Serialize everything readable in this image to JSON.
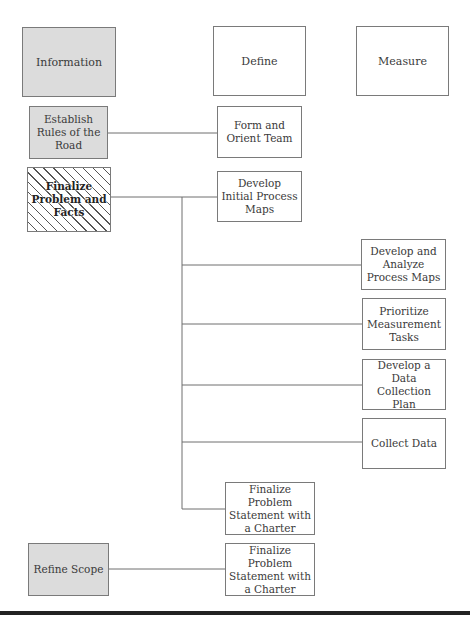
{
  "diagram": {
    "columns": {
      "information": "Information",
      "define": "Define",
      "measure": "Measure"
    },
    "information_steps": {
      "establish_rules": "Establish Rules of the Road",
      "finalize_problem_facts": "Finalize Problem and Facts",
      "refine_scope": "Refine Scope"
    },
    "define_steps": {
      "form_orient_team": "Form and Orient Team",
      "develop_initial_maps": "Develop Initial Process Maps",
      "finalize_statement_1": "Finalize Problem Statement with a Charter",
      "finalize_statement_2": "Finalize Problem Statement with a Charter"
    },
    "measure_steps": {
      "develop_analyze_maps": "Develop and Analyze Process Maps",
      "prioritize_tasks": "Prioritize Measurement Tasks",
      "data_collection_plan": "Develop a Data Collection Plan",
      "collect_data": "Collect Data"
    },
    "colors": {
      "box_border": "#7a7a7a",
      "info_fill": "#dcdcdc",
      "line": "#6e6e6e",
      "text": "#3a3a3a"
    }
  }
}
